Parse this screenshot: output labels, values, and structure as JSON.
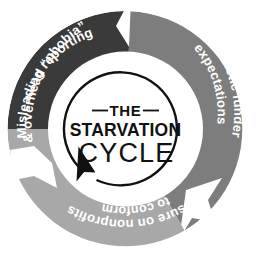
{
  "diagram": {
    "title": "The Starvation Cycle",
    "type": "circular-cycle-donut",
    "direction": "counterclockwise",
    "center": {
      "line1": "THE",
      "line2": "STARVATION",
      "line3": "CYCLE",
      "ring_color": "#111111",
      "arrow_name": "cycle-arrowhead"
    },
    "background_color": "#ffffff",
    "segments": [
      {
        "id": "misleading-reporting",
        "label": "Misleading reporting",
        "label_line2": "& overhead “phobia”",
        "full_label": "Misleading reporting & overhead “phobia”",
        "color": "#3a3a3a",
        "text_color": "#ffffff",
        "position": "upper-left",
        "start_angle": 186,
        "end_angle": 306
      },
      {
        "id": "unrealistic-funder-expectations",
        "label": "Unrealistic funder",
        "label_line2": "expectations",
        "full_label": "Unrealistic funder expectations",
        "color": "#7d7d7d",
        "text_color": "#ffffff",
        "position": "right",
        "start_angle": 306,
        "end_angle": 66
      },
      {
        "id": "pressure-on-nonprofits",
        "label": "Pressure on nonprofits",
        "label_line2": "to conform",
        "full_label": "Pressure on nonprofits to conform",
        "color": "#a8a8a8",
        "text_color": "#ffffff",
        "position": "bottom",
        "start_angle": 66,
        "end_angle": 186
      }
    ]
  }
}
